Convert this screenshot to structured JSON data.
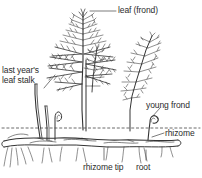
{
  "diagram": {
    "style": "black-and-white line drawing",
    "background_color": "#ffffff",
    "line_color": "#333333",
    "text_color": "#2b2b2b",
    "soil_line": {
      "name": "ground level",
      "style": "dashed",
      "y": 128
    },
    "labels": [
      {
        "id": "leaf-frond",
        "text": "leaf (frond)",
        "x": 118,
        "y": 6,
        "leader": "horizontal-left"
      },
      {
        "id": "last-years-leaf-stalk",
        "text_line1": "last year's",
        "text_line2": "leaf stalk",
        "x": 2,
        "y": 67,
        "leader": "diagonal-right"
      },
      {
        "id": "young-frond",
        "text": "young frond",
        "x": 148,
        "y": 103,
        "leader": "diagonal-down-left"
      },
      {
        "id": "rhizome",
        "text": "rhizome",
        "x": 166,
        "y": 130,
        "leader": "horizontal-left"
      },
      {
        "id": "rhizome-tip",
        "text": "rhizome tip",
        "x": 85,
        "y": 165,
        "leader": "vertical-up"
      },
      {
        "id": "root",
        "text": "root",
        "x": 139,
        "y": 165,
        "leader": "vertical-up"
      }
    ],
    "parts": [
      {
        "name": "leaf (frond)",
        "count": 3,
        "location": "above ground"
      },
      {
        "name": "last year's leaf stalk",
        "count": 2,
        "location": "left, above ground"
      },
      {
        "name": "young frond",
        "count": 2,
        "location": "right, at ground level"
      },
      {
        "name": "rhizome",
        "count": 1,
        "location": "horizontal, below ground"
      },
      {
        "name": "rhizome tip",
        "count": 1,
        "location": "below ground"
      },
      {
        "name": "root",
        "count": "many",
        "location": "below ground"
      }
    ]
  }
}
